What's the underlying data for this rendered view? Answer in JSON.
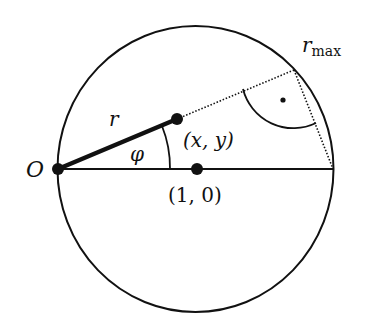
{
  "diagram": {
    "type": "geometry",
    "circle": {
      "cx": 195.5,
      "cy": 169,
      "rx": 138,
      "ry": 143,
      "stroke": "#111111"
    },
    "points": {
      "origin": {
        "x": 58,
        "y": 169,
        "label": "O"
      },
      "center": {
        "x": 197,
        "y": 169,
        "label": "(1, 0)"
      },
      "xy": {
        "x": 177,
        "y": 119,
        "label": "(x, y)"
      },
      "rmax": {
        "x": 294,
        "y": 70
      },
      "right_end": {
        "x": 333,
        "y": 169
      }
    },
    "labels": {
      "O": "O",
      "r": "r",
      "phi": "φ",
      "xy": "(x, y)",
      "center": "(1, 0)",
      "rmax_main": "r",
      "rmax_sub": "max"
    },
    "colors": {
      "stroke": "#111111",
      "background": "#ffffff"
    }
  }
}
